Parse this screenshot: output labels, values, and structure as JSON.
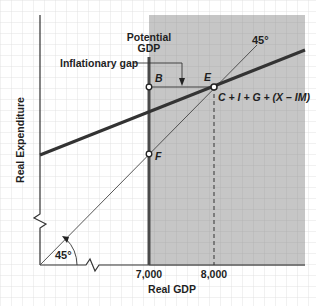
{
  "diagram": {
    "axes": {
      "x_label": "Real GDP",
      "y_label": "Real Expenditure",
      "x_ticks": [
        "7,000",
        "8,000"
      ],
      "angle_label": "45°"
    },
    "labels": {
      "potential_line1": "Potential",
      "potential_line2": "GDP",
      "inflationary_gap": "Inflationary gap",
      "line_45": "45°",
      "expenditure_line": "C + I + G + (X – IM)"
    },
    "points": {
      "B": "B",
      "E": "E",
      "F": "F"
    },
    "colors": {
      "shade": "#c9c9c9",
      "grid": "#d9d9d9",
      "line": "#333333",
      "text": "#1f1f1f"
    }
  }
}
